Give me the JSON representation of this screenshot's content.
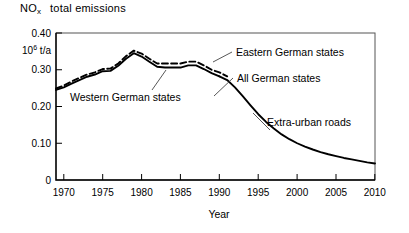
{
  "title": {
    "species": "NO",
    "species_sub": "x",
    "text": "total emissions"
  },
  "axes": {
    "y": {
      "unit_mantissa": "10",
      "unit_exponent": "6",
      "unit_rest": " t/a",
      "ticks": [
        "0.40",
        "0.30",
        "0.20",
        "0.10",
        "0"
      ]
    },
    "x": {
      "name": "Year",
      "ticks": [
        "1970",
        "1975",
        "1980",
        "1985",
        "1990",
        "1995",
        "2000",
        "2005",
        "2010"
      ]
    }
  },
  "annotations": {
    "western": "Western German states",
    "eastern": "Eastern German states",
    "all": "All German states",
    "extra_urban": "Extra-urban roads"
  },
  "chart_data": {
    "type": "line",
    "xlabel": "Year",
    "ylabel": "10^6 t/a",
    "xlim": [
      1969,
      2010
    ],
    "ylim": [
      0,
      0.4
    ],
    "yticks": [
      0,
      0.1,
      0.2,
      0.3,
      0.4
    ],
    "xticks": [
      1970,
      1975,
      1980,
      1985,
      1990,
      1995,
      2000,
      2005,
      2010
    ],
    "grid": false,
    "legend_position": "inline-annotations",
    "subject": "Extra-urban roads",
    "series": [
      {
        "name": "Western German states",
        "style": "solid",
        "x": [
          1969,
          1970,
          1971,
          1972,
          1973,
          1974,
          1975,
          1976,
          1977,
          1978,
          1979,
          1980,
          1981,
          1982,
          1983,
          1984,
          1985,
          1986,
          1987,
          1988,
          1989,
          1990
        ],
        "values": [
          0.245,
          0.252,
          0.262,
          0.272,
          0.281,
          0.287,
          0.296,
          0.297,
          0.311,
          0.33,
          0.345,
          0.336,
          0.322,
          0.308,
          0.306,
          0.306,
          0.306,
          0.312,
          0.312,
          0.302,
          0.291,
          0.282
        ]
      },
      {
        "name": "Eastern German states",
        "style": "dashed",
        "x": [
          1969,
          1970,
          1971,
          1972,
          1973,
          1974,
          1975,
          1976,
          1977,
          1978,
          1979,
          1980,
          1981,
          1982,
          1983,
          1984,
          1985,
          1986,
          1987,
          1988,
          1989,
          1990,
          1991
        ],
        "values": [
          0.249,
          0.257,
          0.268,
          0.278,
          0.287,
          0.293,
          0.302,
          0.303,
          0.317,
          0.337,
          0.352,
          0.344,
          0.33,
          0.317,
          0.317,
          0.317,
          0.317,
          0.322,
          0.322,
          0.312,
          0.3,
          0.293,
          0.282
        ]
      },
      {
        "name": "All German states",
        "style": "solid",
        "x": [
          1990,
          1991,
          1992,
          1993,
          1994,
          1995,
          1996,
          1997,
          1998,
          1999,
          2000,
          2001,
          2002,
          2003,
          2004,
          2005,
          2006,
          2007,
          2008,
          2009,
          2010
        ],
        "values": [
          0.282,
          0.272,
          0.252,
          0.228,
          0.203,
          0.179,
          0.158,
          0.14,
          0.124,
          0.111,
          0.1,
          0.091,
          0.083,
          0.076,
          0.07,
          0.065,
          0.06,
          0.056,
          0.052,
          0.048,
          0.045
        ]
      }
    ]
  }
}
